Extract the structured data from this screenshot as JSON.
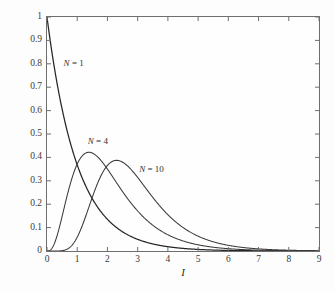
{
  "chart_data": {
    "type": "line",
    "title": "",
    "subtitle": "",
    "xlabel": "I",
    "ylabel": "pdf of I_max",
    "xlim": [
      0,
      9
    ],
    "ylim": [
      0,
      1
    ],
    "grid": false,
    "legend_position": "inline-annotations",
    "xticks": [
      "0",
      "1",
      "2",
      "3",
      "4",
      "5",
      "6",
      "7",
      "8",
      "9"
    ],
    "xtick_values": [
      0,
      1,
      2,
      3,
      4,
      5,
      6,
      7,
      8,
      9
    ],
    "yticks": [
      "0",
      "0.1",
      "0.2",
      "0.3",
      "0.4",
      "0.5",
      "0.6",
      "0.7",
      "0.8",
      "0.9",
      "1"
    ],
    "ytick_values": [
      0,
      0.1,
      0.2,
      0.3,
      0.4,
      0.5,
      0.6,
      0.7,
      0.8,
      0.9,
      1.0
    ],
    "annotations": [
      {
        "text": "N = 1",
        "n": 1,
        "x": 0.55,
        "y": 0.8
      },
      {
        "text": "N = 4",
        "n": 4,
        "x": 1.35,
        "y": 0.465
      },
      {
        "text": "N = 10",
        "n": 10,
        "x": 3.05,
        "y": 0.345
      }
    ],
    "series": [
      {
        "name": "N = 1",
        "color": "#262626",
        "peak_x": 0.0,
        "peak_y": 1.0,
        "x": [
          0,
          0.2,
          0.4,
          0.6,
          0.8,
          1.0,
          1.2,
          1.4,
          1.6,
          1.8,
          2.0,
          2.25,
          2.5,
          2.75,
          3.0,
          3.5,
          4.0,
          4.5,
          5.0,
          5.5,
          6.0,
          6.5,
          7.0,
          7.5,
          8.0,
          8.5,
          9.0
        ],
        "values": [
          1.0,
          0.819,
          0.67,
          0.549,
          0.449,
          0.368,
          0.301,
          0.247,
          0.202,
          0.165,
          0.135,
          0.105,
          0.082,
          0.064,
          0.05,
          0.03,
          0.018,
          0.011,
          0.0067,
          0.0041,
          0.0025,
          0.0015,
          0.0009,
          0.0006,
          0.0003,
          0.0002,
          0.0001
        ]
      },
      {
        "name": "N = 4",
        "color": "#3a3a3a",
        "peak_x": 1.39,
        "peak_y": 0.422,
        "x": [
          0,
          0.2,
          0.4,
          0.6,
          0.8,
          1.0,
          1.2,
          1.39,
          1.6,
          1.8,
          2.0,
          2.25,
          2.5,
          2.75,
          3.0,
          3.5,
          4.0,
          4.5,
          5.0,
          5.5,
          6.0,
          6.5,
          7.0,
          7.5,
          8.0,
          8.5,
          9.0
        ],
        "values": [
          0.0,
          0.0222,
          0.0721,
          0.1288,
          0.1809,
          0.2221,
          0.2504,
          0.2644,
          0.2681,
          0.2599,
          0.2441,
          0.2171,
          0.1871,
          0.1578,
          0.1313,
          0.089,
          0.0586,
          0.0377,
          0.0239,
          0.015,
          0.0093,
          0.0057,
          0.0035,
          0.0021,
          0.0013,
          0.0008,
          0.0005
        ]
      },
      {
        "name": "N = 10",
        "color": "#3a3a3a",
        "peak_x": 2.35,
        "peak_y": 0.385,
        "x": [
          0,
          0.5,
          1.0,
          1.5,
          2.0,
          2.35,
          2.5,
          3.0,
          3.5,
          4.0,
          4.5,
          5.0,
          5.5,
          6.0,
          6.5,
          7.0,
          7.5,
          8.0,
          8.5,
          9.0
        ],
        "values": [
          0.0,
          0.0002,
          0.0112,
          0.0726,
          0.1678,
          0.2157,
          0.226,
          0.2291,
          0.1951,
          0.1487,
          0.1063,
          0.0731,
          0.049,
          0.0322,
          0.0209,
          0.0134,
          0.0085,
          0.0053,
          0.0033,
          0.0021
        ]
      }
    ],
    "formula_note": "pdf of max of N exponentials: N e^{-x}(1-e^{-x})^{N-1}"
  }
}
